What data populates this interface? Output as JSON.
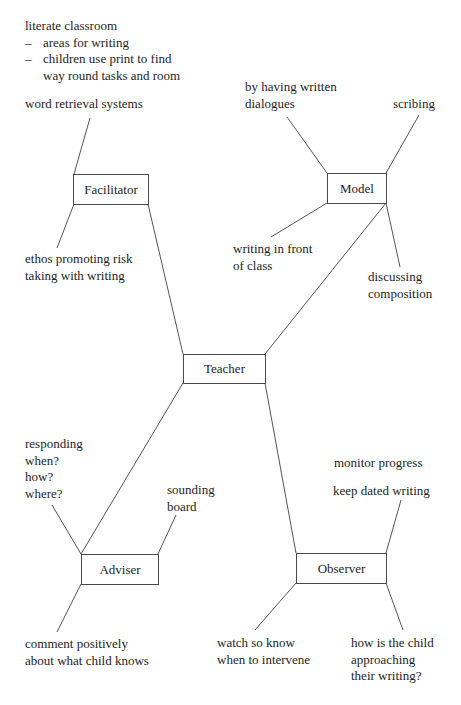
{
  "diagram": {
    "central_node": "Teacher",
    "nodes": {
      "facilitator": {
        "label": "Facilitator",
        "notes": {
          "literate_classroom": {
            "title": "literate classroom",
            "bullets": [
              "areas for writing",
              "children use print to find",
              "way round tasks and room"
            ],
            "bullet_marker": "–"
          },
          "word_retrieval": "word retrieval systems",
          "ethos": [
            "ethos promoting risk",
            "taking with writing"
          ]
        }
      },
      "model": {
        "label": "Model",
        "notes": {
          "written_dialogues": [
            "by having written",
            "dialogues"
          ],
          "scribing": "scribing",
          "writing_in_front": [
            "writing in front",
            "of class"
          ],
          "discussing": [
            "discussing",
            "composition"
          ]
        }
      },
      "adviser": {
        "label": "Adviser",
        "notes": {
          "responding": [
            "responding",
            "when?",
            "how?",
            "where?"
          ],
          "sounding_board": [
            "sounding",
            "board"
          ],
          "comment": [
            "comment positively",
            "about what child knows"
          ]
        }
      },
      "observer": {
        "label": "Observer",
        "notes": {
          "monitor": "monitor progress",
          "keep_dated": "keep dated writing",
          "watch": [
            "watch so know",
            "when to intervene"
          ],
          "how_child": [
            "how is the child",
            "approaching",
            "their writing?"
          ]
        }
      }
    },
    "colors": {
      "line": "#555555",
      "text": "#1e1e1e",
      "box_border": "#4a4a4a"
    }
  }
}
